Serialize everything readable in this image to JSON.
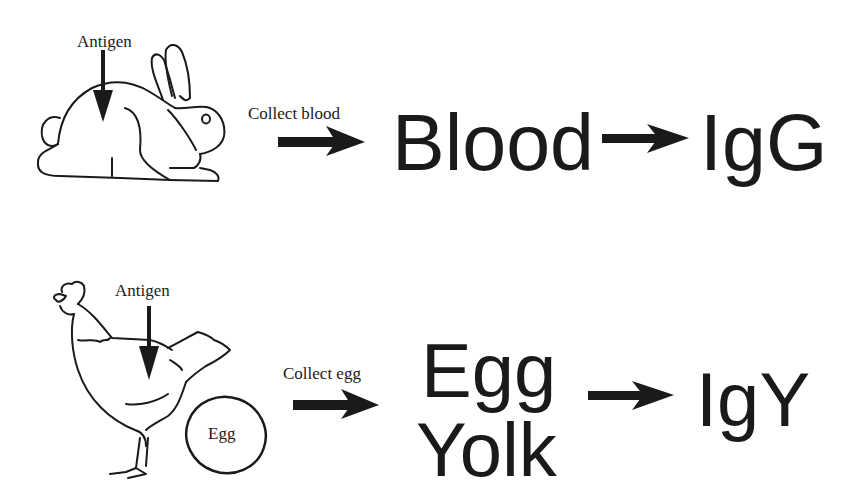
{
  "rows": [
    {
      "animal": "rabbit",
      "antigen_label": "Antigen",
      "collect_label": "Collect blood",
      "source": [
        "Blood"
      ],
      "antibody": "IgG"
    },
    {
      "animal": "chicken",
      "antigen_label": "Antigen",
      "egg_label": "Egg",
      "collect_label": "Collect egg",
      "source": [
        "Egg",
        "Yolk"
      ],
      "antibody": "IgY"
    }
  ],
  "colors": {
    "ink": "#1a1a1a",
    "background": "#ffffff"
  }
}
